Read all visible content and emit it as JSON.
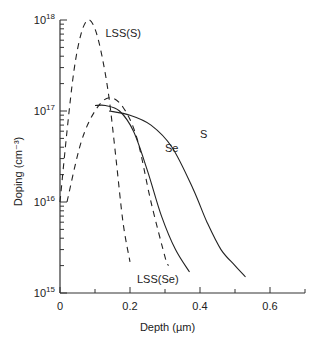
{
  "chart_data": {
    "type": "line",
    "title": "",
    "xlabel": "Depth (µm)",
    "ylabel": "Doping (cm⁻³)",
    "xlim": [
      0,
      0.7
    ],
    "ylim": [
      1000000000000000.0,
      1e+18
    ],
    "yscale": "log",
    "x_ticks": [
      0,
      0.2,
      0.4,
      0.6
    ],
    "x_tick_labels": [
      "0",
      "0.2",
      "0.4",
      "0.6"
    ],
    "y_ticks": [
      1000000000000000.0,
      1e+16,
      1e+17,
      1e+18
    ],
    "y_tick_labels": [
      {
        "base": "10",
        "exp": "15"
      },
      {
        "base": "10",
        "exp": "16"
      },
      {
        "base": "10",
        "exp": "17"
      },
      {
        "base": "10",
        "exp": "18"
      }
    ],
    "grid": false,
    "legend": "none",
    "series": [
      {
        "name": "LSS(S)",
        "style": "dashed",
        "x": [
          0.0,
          0.02,
          0.04,
          0.06,
          0.08,
          0.1,
          0.12,
          0.14,
          0.16,
          0.18,
          0.2
        ],
        "y": [
          1e+16,
          6e+16,
          2.8e+17,
          7e+17,
          1e+18,
          8e+17,
          4e+17,
          1.4e+17,
          3e+16,
          6000000000000000.0,
          2200000000000000.0
        ]
      },
      {
        "name": "LSS(Se)",
        "style": "dashed",
        "x": [
          0.02,
          0.06,
          0.1,
          0.14,
          0.18,
          0.22,
          0.26,
          0.3,
          0.31
        ],
        "y": [
          1e+16,
          4.5e+16,
          1e+17,
          1.4e+17,
          1.1e+17,
          5e+16,
          1e+16,
          2500000000000000.0,
          2000000000000000.0
        ]
      },
      {
        "name": "Se",
        "style": "solid",
        "x": [
          0.1,
          0.13,
          0.17,
          0.21,
          0.25,
          0.29,
          0.33,
          0.37
        ],
        "y": [
          1.15e+17,
          1.15e+17,
          1e+17,
          6e+16,
          2.2e+16,
          7000000000000000.0,
          3000000000000000.0,
          1700000000000000.0
        ]
      },
      {
        "name": "S",
        "style": "solid",
        "x": [
          0.14,
          0.2,
          0.26,
          0.32,
          0.38,
          0.42,
          0.46,
          0.5,
          0.53
        ],
        "y": [
          1e+17,
          9e+16,
          7e+16,
          4e+16,
          1.4e+16,
          6000000000000000.0,
          3000000000000000.0,
          2000000000000000.0,
          1500000000000000.0
        ]
      }
    ],
    "annotations": [
      {
        "text": "LSS(S)",
        "x": 0.13,
        "y": 6.5e+17
      },
      {
        "text": "Se",
        "x": 0.3,
        "y": 3.5e+16
      },
      {
        "text": "S",
        "x": 0.4,
        "y": 5e+16
      },
      {
        "text": "LSS(Se)",
        "x": 0.22,
        "y": 1300000000000000.0
      }
    ]
  }
}
